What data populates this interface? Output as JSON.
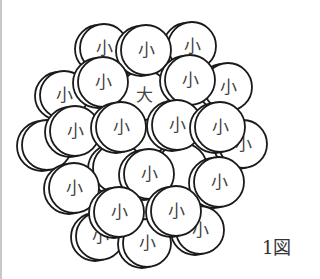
{
  "figure": {
    "caption": "1図",
    "stroke_color": "#1a1a1a",
    "fill_color": "#ffffff",
    "label_color": "#444444"
  },
  "disks": [
    {
      "id": "far-left-edge",
      "label": "",
      "cx": 47,
      "cy": 145,
      "r": 25,
      "layer": 0
    },
    {
      "id": "hidden-center-left",
      "label": "",
      "cx": 118,
      "cy": 168,
      "r": 25,
      "layer": 0
    },
    {
      "id": "hidden-center-right",
      "label": "",
      "cx": 182,
      "cy": 168,
      "r": 25,
      "layer": 0
    },
    {
      "id": "back-top-left",
      "label": "小",
      "cx": 104,
      "cy": 48,
      "r": 24,
      "layer": 1
    },
    {
      "id": "back-top-right",
      "label": "小",
      "cx": 192,
      "cy": 46,
      "r": 24,
      "layer": 1
    },
    {
      "id": "back-left",
      "label": "小",
      "cx": 64,
      "cy": 95,
      "r": 24,
      "layer": 1
    },
    {
      "id": "back-right",
      "label": "小",
      "cx": 228,
      "cy": 87,
      "r": 24,
      "layer": 1
    },
    {
      "id": "back-far-right",
      "label": "小",
      "cx": 243,
      "cy": 144,
      "r": 24,
      "layer": 1
    },
    {
      "id": "back-bottom-left",
      "label": "小",
      "cx": 100,
      "cy": 236,
      "r": 24,
      "layer": 1
    },
    {
      "id": "back-bottom-right",
      "label": "小",
      "cx": 200,
      "cy": 230,
      "r": 24,
      "layer": 1
    },
    {
      "id": "back-bottom",
      "label": "小",
      "cx": 147,
      "cy": 243,
      "r": 24,
      "layer": 1
    },
    {
      "id": "center-large",
      "label": "大",
      "cx": 144,
      "cy": 95,
      "r": 25,
      "layer": 2
    },
    {
      "id": "front-top",
      "label": "小",
      "cx": 146,
      "cy": 50,
      "r": 25,
      "layer": 3
    },
    {
      "id": "front-upper-left",
      "label": "小",
      "cx": 103,
      "cy": 82,
      "r": 25,
      "layer": 3
    },
    {
      "id": "front-upper-right",
      "label": "小",
      "cx": 190,
      "cy": 80,
      "r": 25,
      "layer": 3
    },
    {
      "id": "front-mid-left",
      "label": "小",
      "cx": 75,
      "cy": 131,
      "r": 25,
      "layer": 4
    },
    {
      "id": "front-mid-center-left",
      "label": "小",
      "cx": 121,
      "cy": 127,
      "r": 25,
      "layer": 4
    },
    {
      "id": "front-mid-center-right",
      "label": "小",
      "cx": 177,
      "cy": 125,
      "r": 25,
      "layer": 4
    },
    {
      "id": "front-mid-right",
      "label": "小",
      "cx": 220,
      "cy": 127,
      "r": 25,
      "layer": 4
    },
    {
      "id": "front-center-low",
      "label": "小",
      "cx": 149,
      "cy": 174,
      "r": 25,
      "layer": 5
    },
    {
      "id": "front-right-low",
      "label": "小",
      "cx": 219,
      "cy": 182,
      "r": 25,
      "layer": 5
    },
    {
      "id": "front-left-low",
      "label": "小",
      "cx": 74,
      "cy": 188,
      "r": 25,
      "layer": 5
    },
    {
      "id": "front-bottom-left",
      "label": "小",
      "cx": 119,
      "cy": 212,
      "r": 25,
      "layer": 6
    },
    {
      "id": "front-bottom-right",
      "label": "小",
      "cx": 176,
      "cy": 211,
      "r": 25,
      "layer": 6
    }
  ]
}
